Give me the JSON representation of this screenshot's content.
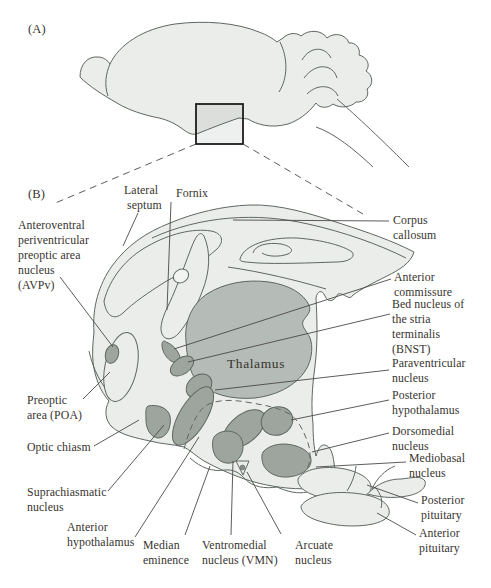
{
  "figure": {
    "panel_a_tag": "(A)",
    "panel_b_tag": "(B)"
  },
  "labels": {
    "lateral_septum": {
      "lines": [
        "Lateral",
        "septum"
      ]
    },
    "fornix": {
      "lines": [
        "Fornix"
      ]
    },
    "avpv": {
      "lines": [
        "Anteroventral",
        "periventricular",
        "preoptic area",
        "nucleus",
        "(AVPv)"
      ]
    },
    "corpus_callosum": {
      "lines": [
        "Corpus",
        "callosum"
      ]
    },
    "anterior_commissure": {
      "lines": [
        "Anterior",
        "commissure"
      ]
    },
    "bnst": {
      "lines": [
        "Bed nucleus of",
        "the stria",
        "terminalis",
        "(BNST)"
      ]
    },
    "thalamus": {
      "lines": [
        "Thalamus"
      ]
    },
    "paraventricular": {
      "lines": [
        "Paraventricular",
        "nucleus"
      ]
    },
    "preoptic_area": {
      "lines": [
        "Preoptic",
        "area (POA)"
      ]
    },
    "posterior_hypothalamus": {
      "lines": [
        "Posterior",
        "hypothalamus"
      ]
    },
    "optic_chiasm": {
      "lines": [
        "Optic chiasm"
      ]
    },
    "dorsomedial": {
      "lines": [
        "Dorsomedial",
        "nucleus"
      ]
    },
    "mediobasal": {
      "lines": [
        "Mediobasal",
        "nucleus"
      ]
    },
    "suprachiasmatic": {
      "lines": [
        "Suprachiasmatic",
        "nucleus"
      ]
    },
    "posterior_pituitary": {
      "lines": [
        "Posterior",
        "pituitary"
      ]
    },
    "anterior_hypothalamus": {
      "lines": [
        "Anterior",
        "hypothalamus"
      ]
    },
    "median_eminence": {
      "lines": [
        "Median",
        "eminence"
      ]
    },
    "vmn": {
      "lines": [
        "Ventromedial",
        "nucleus (VMN)"
      ]
    },
    "arcuate": {
      "lines": [
        "Arcuate",
        "nucleus"
      ]
    },
    "anterior_pituitary": {
      "lines": [
        "Anterior",
        "pituitary"
      ]
    }
  },
  "colors": {
    "tissue": "#eaede9",
    "thalamus": "#b5bbb6",
    "nucleus": "#9ea59f",
    "outline": "#5f6762",
    "leader": "#4a4a46",
    "text": "#37332e",
    "background": "#ffffff"
  }
}
